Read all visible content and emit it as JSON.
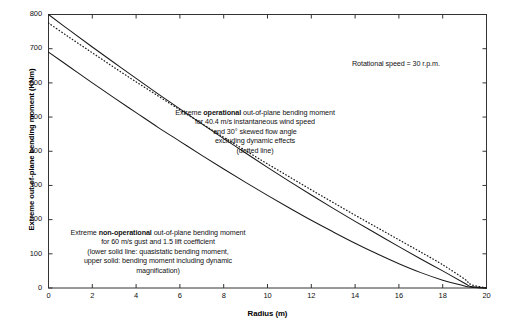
{
  "chart_data": {
    "type": "line",
    "title": "",
    "xlabel": "Radius (m)",
    "ylabel": "Extreme out-of-plane bending moment (KNm)",
    "xlim": [
      0,
      20
    ],
    "ylim": [
      0,
      800
    ],
    "xticks": [
      0,
      2,
      4,
      6,
      8,
      10,
      12,
      14,
      16,
      18,
      20
    ],
    "yticks": [
      0,
      100,
      200,
      300,
      400,
      500,
      600,
      700,
      800
    ],
    "grid": false,
    "legend_position": "none",
    "x": [
      0,
      1,
      2,
      3,
      4,
      5,
      6,
      7,
      8,
      9,
      10,
      11,
      12,
      13,
      14,
      15,
      16,
      17,
      18,
      19,
      19.3,
      20
    ],
    "series": [
      {
        "name": "Extreme non-operational, including dynamic magnification (upper solid line)",
        "style": "solid",
        "color": "#1a1a1a",
        "values": [
          800,
          752,
          705,
          659,
          613,
          568,
          524,
          480,
          437,
          395,
          353,
          312,
          272,
          233,
          195,
          158,
          121,
          85,
          50,
          14,
          4,
          0
        ]
      },
      {
        "name": "Extreme operational, excluding dynamic effects (dotted line)",
        "style": "dotted",
        "color": "#1a1a1a",
        "values": [
          775,
          731,
          688,
          645,
          603,
          562,
          521,
          481,
          441,
          402,
          363,
          325,
          287,
          250,
          213,
          177,
          141,
          105,
          68,
          26,
          10,
          0
        ]
      },
      {
        "name": "Extreme non-operational, quasistatic bending moment (lower solid line)",
        "style": "solid",
        "color": "#1a1a1a",
        "values": [
          690,
          645,
          600,
          556,
          513,
          470,
          429,
          388,
          348,
          309,
          271,
          234,
          198,
          164,
          131,
          100,
          71,
          45,
          23,
          6,
          2,
          0
        ]
      }
    ],
    "annotations": [
      {
        "id": "rotational-speed",
        "lines": [
          {
            "text": "Rotational speed = 30 r.p.m."
          }
        ]
      },
      {
        "id": "operational",
        "lines": [
          {
            "pre": "Extreme ",
            "bold": "operational",
            "post": " out-of-plane bending moment"
          },
          {
            "text": "for 40.4 m/s instantaneous wind speed"
          },
          {
            "text": "and 30° skewed flow angle"
          },
          {
            "text": "excluding dynamic effects"
          },
          {
            "text": "(dotted line)"
          }
        ]
      },
      {
        "id": "non-operational",
        "lines": [
          {
            "pre": "Extreme ",
            "bold": "non-operational",
            "post": " out-of-plane bending moment"
          },
          {
            "text": "for 60 m/s gust and 1.5 lift coefficient"
          },
          {
            "text": "(lower solid line: quasistatic bending moment,"
          },
          {
            "text": "upper solid: bending moment including dynamic"
          },
          {
            "text": "magnification)"
          }
        ]
      }
    ]
  },
  "axis": {
    "y_labels": [
      "800",
      "700",
      "600",
      "500",
      "400",
      "300",
      "200",
      "100",
      "0"
    ],
    "x_labels": [
      "0",
      "2",
      "4",
      "6",
      "8",
      "10",
      "12",
      "14",
      "16",
      "18",
      "20"
    ],
    "x_title": "Radius (m)",
    "y_title": "Extreme out-of-plane bending moment (KNm)"
  },
  "annotations": {
    "speed": {
      "line1": "Rotational speed = 30 r.p.m."
    },
    "operational": {
      "l1a": "Extreme ",
      "l1b": "operational",
      "l1c": " out-of-plane bending moment",
      "l2": "for 40.4 m/s instantaneous wind speed",
      "l3": "and 30° skewed flow angle",
      "l4": "excluding dynamic effects",
      "l5": "(dotted line)"
    },
    "nonoperational": {
      "l1a": "Extreme ",
      "l1b": "non-operational",
      "l1c": " out-of-plane bending moment",
      "l2": "for 60 m/s gust and 1.5 lift coefficient",
      "l3": "(lower solid line: quasistatic bending moment,",
      "l4": "upper solid: bending moment including dynamic",
      "l5": "magnification)"
    }
  },
  "colors": {
    "axis": "#333333",
    "curve": "#1a1a1a",
    "background": "#ffffff"
  }
}
